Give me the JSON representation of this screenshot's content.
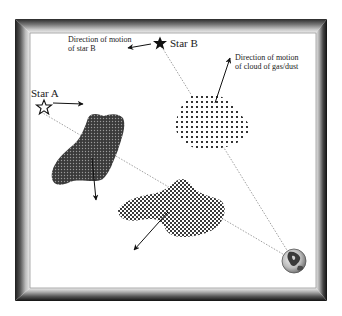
{
  "diagram": {
    "labels": {
      "star_a": "Star A",
      "star_b": "Star B",
      "star_b_motion_line1": "Direction of motion",
      "star_b_motion_line2": "of star B",
      "cloud_motion_line1": "Direction of motion",
      "cloud_motion_line2": "of cloud of gas/dust"
    },
    "objects": [
      {
        "name": "Star A",
        "icon": "star-outline-icon"
      },
      {
        "name": "Star B",
        "icon": "star-filled-icon"
      },
      {
        "name": "Earth",
        "icon": "globe-icon"
      },
      {
        "name": "dark cloud",
        "pattern": "dense-dots"
      },
      {
        "name": "light cloud",
        "pattern": "sparse-dots"
      },
      {
        "name": "checkered cloud",
        "pattern": "checker"
      }
    ],
    "colors": {
      "frame_dark": "#2a2a2a",
      "frame_light": "#d8d8d8",
      "ink": "#1a1a1a",
      "sightline": "#888888"
    }
  }
}
